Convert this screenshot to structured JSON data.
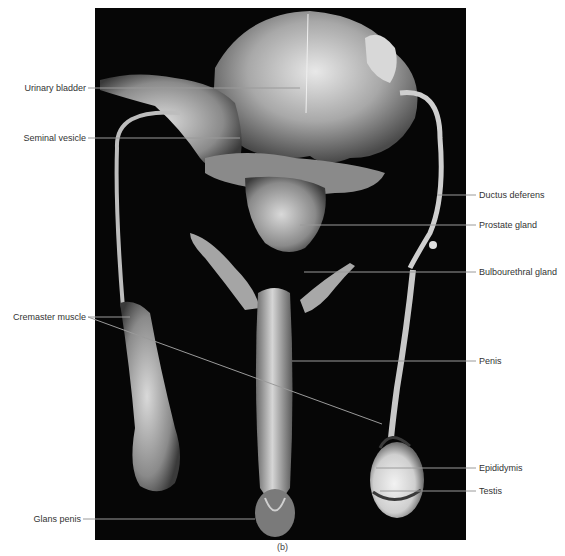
{
  "figure": {
    "caption": "(b)",
    "background_color": "#ffffff",
    "photo_background": "#060606",
    "leader_color": "#9a9a9a",
    "text_color": "#333333"
  },
  "labels": {
    "left": [
      {
        "id": "urinary-bladder",
        "text": "Urinary bladder"
      },
      {
        "id": "seminal-vesicle",
        "text": "Seminal vesicle"
      },
      {
        "id": "cremaster-muscle",
        "text": "Cremaster muscle"
      },
      {
        "id": "glans-penis",
        "text": "Glans penis"
      }
    ],
    "right": [
      {
        "id": "ductus-deferens",
        "text": "Ductus deferens"
      },
      {
        "id": "prostate-gland",
        "text": "Prostate gland"
      },
      {
        "id": "bulbourethral-gland",
        "text": "Bulbourethral gland"
      },
      {
        "id": "penis",
        "text": "Penis"
      },
      {
        "id": "epididymis",
        "text": "Epididymis"
      },
      {
        "id": "testis",
        "text": "Testis"
      }
    ]
  }
}
